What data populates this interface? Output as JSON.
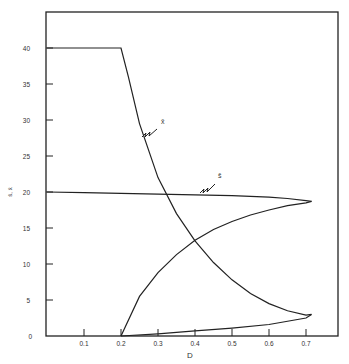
{
  "chart_data": {
    "type": "line",
    "title": "",
    "xlabel": "D",
    "ylabel": "s̄, x̄",
    "xlim": [
      0,
      0.8
    ],
    "ylim": [
      0,
      45
    ],
    "x_ticks": [
      "0.1",
      "0.2",
      "0.3",
      "0.4",
      "0.5",
      "0.6",
      "0.7"
    ],
    "y_ticks": [
      "0",
      "5",
      "10",
      "15",
      "20",
      "25",
      "30",
      "35",
      "40"
    ],
    "grid": false,
    "series": [
      {
        "name": "x̄ (stable)",
        "x": [
          0,
          0.2,
          0.22,
          0.25,
          0.3,
          0.35,
          0.4,
          0.45,
          0.5,
          0.55,
          0.6,
          0.65,
          0.7,
          0.715
        ],
        "y": [
          40,
          40,
          36,
          29.5,
          22,
          17,
          13.2,
          10.2,
          7.8,
          5.9,
          4.5,
          3.5,
          2.9,
          3
        ]
      },
      {
        "name": "x̄ (unstable)",
        "x": [
          0.2,
          0.3,
          0.4,
          0.5,
          0.6,
          0.7,
          0.715
        ],
        "y": [
          0,
          0.3,
          0.7,
          1.1,
          1.6,
          2.5,
          3
        ]
      },
      {
        "name": "s̄ (stable)",
        "x": [
          0,
          0.1,
          0.2,
          0.3,
          0.4,
          0.5,
          0.6,
          0.65,
          0.7,
          0.715
        ],
        "y": [
          20,
          19.9,
          19.8,
          19.7,
          19.6,
          19.5,
          19.3,
          19.1,
          18.8,
          18.7
        ]
      },
      {
        "name": "s̄ (unstable)",
        "x": [
          0.2,
          0.25,
          0.3,
          0.35,
          0.4,
          0.45,
          0.5,
          0.55,
          0.6,
          0.65,
          0.7,
          0.715
        ],
        "y": [
          0,
          5.5,
          8.8,
          11.3,
          13.3,
          14.8,
          15.9,
          16.8,
          17.5,
          18.1,
          18.5,
          18.7
        ]
      }
    ],
    "annotations": [
      {
        "text": "x̄",
        "attached_to": "upper descending curve near D≈0.27"
      },
      {
        "text": "s̄",
        "attached_to": "s̄=20 curve near D≈0.42"
      }
    ]
  }
}
